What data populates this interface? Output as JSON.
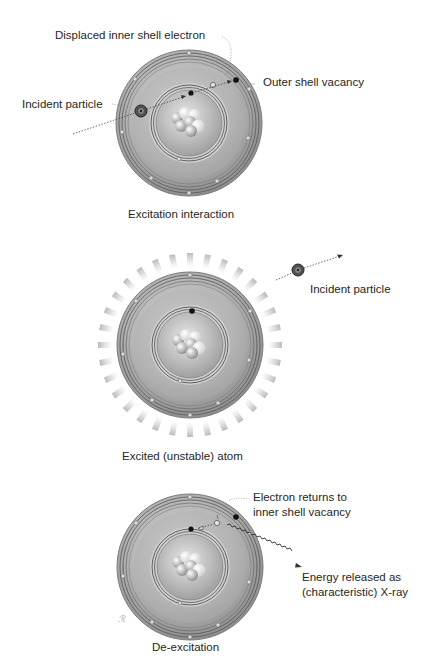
{
  "panels": [
    {
      "id": "excitation",
      "caption": "Excitation interaction",
      "labels": {
        "displaced": "Displaced inner shell electron",
        "vacancy": "Outer shell vacancy",
        "incident": "Incident particle"
      }
    },
    {
      "id": "excited",
      "caption": "Excited (unstable) atom",
      "labels": {
        "incident": "Incident particle"
      }
    },
    {
      "id": "de-excitation",
      "caption": "De-excitation",
      "labels": {
        "returns_line1": "Electron returns to",
        "returns_line2": "inner shell vacancy",
        "energy_line1": "Energy released as",
        "energy_line2": "(characteristic) X-ray"
      }
    }
  ],
  "colors": {
    "atom_outer": "#bdbdbd",
    "atom_mid": "#a9a9a9",
    "inner_zone": "#d6d6d6",
    "shell_lines": "#555555",
    "electron": "#111111"
  }
}
